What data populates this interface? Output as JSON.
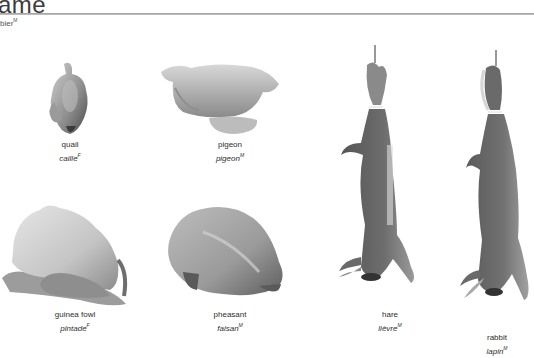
{
  "header": {
    "title": "ame",
    "subtitle": "bier",
    "subtitle_gender": "M"
  },
  "items": [
    {
      "en": "quail",
      "fr": "caille",
      "gender": "F"
    },
    {
      "en": "pigeon",
      "fr": "pigeon",
      "gender": "M"
    },
    {
      "en": "guinea fowl",
      "fr": "pintade",
      "gender": "F"
    },
    {
      "en": "pheasant",
      "fr": "faisan",
      "gender": "M"
    },
    {
      "en": "hare",
      "fr": "lièvre",
      "gender": "M"
    },
    {
      "en": "rabbit",
      "fr": "lapin",
      "gender": "M"
    }
  ],
  "colors": {
    "poultry_light": "#d6d6d6",
    "poultry_mid": "#a9a9a9",
    "poultry_dark": "#6e6e6e",
    "fur_dark": "#5a5a5a",
    "fur_mid": "#7a7a7a",
    "rule": "#a0a0a0"
  }
}
